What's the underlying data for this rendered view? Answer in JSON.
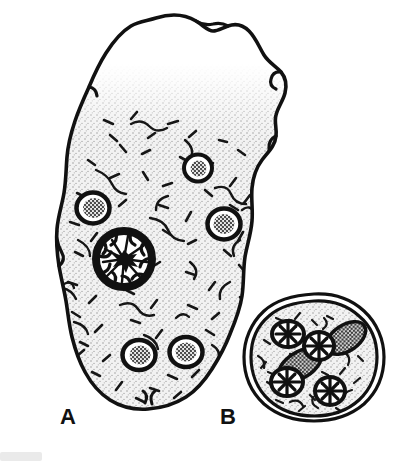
{
  "figure": {
    "kind": "scientific-line-drawing",
    "background_color": "#ffffff",
    "ink_color": "#111111",
    "cytoplasm_fill": "#f0f0f0",
    "granule_gray": "#8e8e8e",
    "width": 404,
    "height": 464
  },
  "labels": {
    "a": "A",
    "b": "B"
  },
  "panels": [
    {
      "id": "a",
      "label": "A",
      "name": "trophozoite",
      "description": "Amoeba trophozoite with clear hyaline pseudopod at top and granular stippled endoplasm",
      "outline_cx": 148,
      "outline_cy": 215,
      "features": {
        "pseudopod": "clear ectoplasm lobe, upper portion, unstippled",
        "endoplasm": "stippled granular cytoplasm with short dark chromatin dashes",
        "nucleus_count": 1,
        "food_vacuole_count": 5
      },
      "nucleus": {
        "name": "nucleus-with-karyosome",
        "cx": 124,
        "cy": 259,
        "r": 29,
        "ring_width": 7,
        "karyosome": "central star-shaped dark karyosome with radial linin spokes",
        "peripheral_chromatin": "thick beaded ring"
      },
      "vacuoles": [
        {
          "name": "food-vacuole-1",
          "cx": 198,
          "cy": 168,
          "rx": 14,
          "ry": 13
        },
        {
          "name": "food-vacuole-2",
          "cx": 93,
          "cy": 208,
          "rx": 16,
          "ry": 15
        },
        {
          "name": "food-vacuole-3",
          "cx": 224,
          "cy": 224,
          "rx": 16,
          "ry": 15
        },
        {
          "name": "food-vacuole-4",
          "cx": 139,
          "cy": 355,
          "rx": 16,
          "ry": 15
        },
        {
          "name": "food-vacuole-5",
          "cx": 186,
          "cy": 352,
          "rx": 16,
          "ry": 15
        }
      ]
    },
    {
      "id": "b",
      "label": "B",
      "name": "cyst",
      "description": "Mature quadrinucleate cyst with double cyst wall and two chromatoid bodies",
      "cx": 314,
      "cy": 358,
      "rx": 58,
      "ry": 57,
      "wall": "double-layered cyst wall",
      "nuclei": [
        {
          "name": "cyst-nucleus-1",
          "cx": 288,
          "cy": 334,
          "rx": 16,
          "ry": 13
        },
        {
          "name": "cyst-nucleus-2",
          "cx": 319,
          "cy": 346,
          "rx": 15,
          "ry": 14
        },
        {
          "name": "cyst-nucleus-3",
          "cx": 287,
          "cy": 382,
          "rx": 16,
          "ry": 14
        },
        {
          "name": "cyst-nucleus-4",
          "cx": 330,
          "cy": 391,
          "rx": 15,
          "ry": 14
        }
      ],
      "chromatoid_bodies": [
        {
          "name": "chromatoid-body-1",
          "cx": 346,
          "cy": 338,
          "rx": 22,
          "ry": 13,
          "rotation": -34
        },
        {
          "name": "chromatoid-body-2",
          "cx": 300,
          "cy": 365,
          "rx": 24,
          "ry": 13,
          "rotation": -32
        }
      ]
    }
  ]
}
